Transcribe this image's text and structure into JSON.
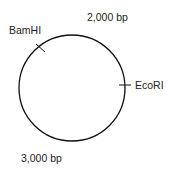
{
  "diagram": {
    "type": "plasmid-map",
    "labels": {
      "bamhi": "BamHI",
      "ecori": "EcoRI",
      "pos_2000": "2,000 bp",
      "pos_3000": "3,000 bp"
    },
    "colors": {
      "stroke": "#111111",
      "text": "#222222",
      "background": "#ffffff"
    }
  }
}
